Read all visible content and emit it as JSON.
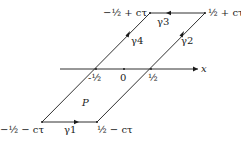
{
  "diagram": {
    "type": "parallelogram-contour",
    "axis": {
      "label": "x",
      "ticks": [
        "-½",
        "0",
        "½"
      ]
    },
    "region_label": "P",
    "vertices": {
      "top_left": {
        "label": "−½ + cτ"
      },
      "top_right": {
        "label": "½ + cτ"
      },
      "bottom_left": {
        "label": "−½ − cτ"
      },
      "bottom_right": {
        "label": "½ − cτ"
      }
    },
    "edges": [
      {
        "name": "γ1",
        "from": "bottom_left",
        "to": "bottom_right",
        "direction": "right"
      },
      {
        "name": "γ2",
        "from": "bottom_right",
        "to": "top_right",
        "direction": "up-right"
      },
      {
        "name": "γ3",
        "from": "top_right",
        "to": "top_left",
        "direction": "left"
      },
      {
        "name": "γ4",
        "from": "bottom_left",
        "to": "top_left",
        "direction": "up-right"
      }
    ],
    "colors": {
      "ink": "#1a1a1a",
      "background": "#ffffff"
    }
  }
}
